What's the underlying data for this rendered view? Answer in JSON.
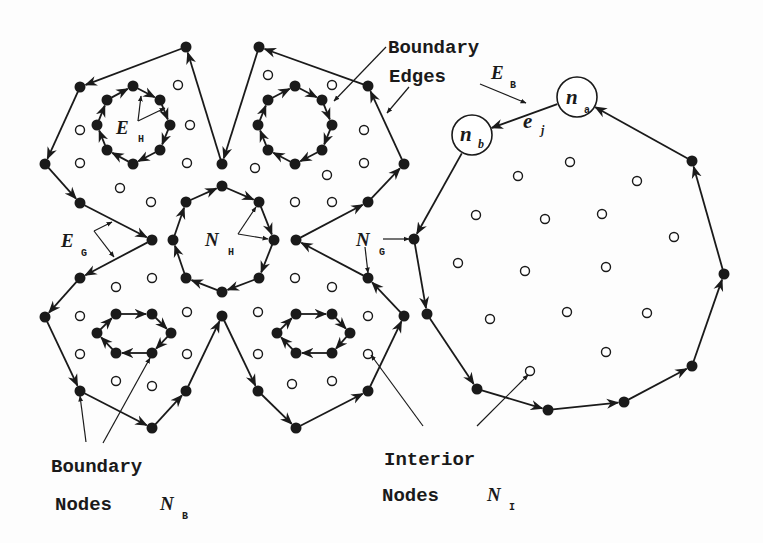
{
  "diagram": {
    "colors": {
      "ink": "#1a1a1a",
      "background": "#fdfdfd",
      "interior_node_fill": "#ffffff"
    },
    "labels": {
      "boundary_edges_line1": "Boundary",
      "boundary_edges_line2": "Edges",
      "boundary_nodes_line1": "Boundary",
      "boundary_nodes_line2": "Nodes",
      "interior_nodes_line1": "Interior",
      "interior_nodes_line2": "Nodes"
    },
    "symbols": {
      "E_B": {
        "main": "E",
        "sub": "B"
      },
      "E_H": {
        "main": "E",
        "sub": "H"
      },
      "E_G": {
        "main": "E",
        "sub": "G"
      },
      "N_H": {
        "main": "N",
        "sub": "H"
      },
      "N_G": {
        "main": "N",
        "sub": "G"
      },
      "N_B": {
        "main": "N",
        "sub": "B"
      },
      "N_I": {
        "main": "N",
        "sub": "I"
      },
      "n_a": {
        "main": "n",
        "sub": "a"
      },
      "n_b": {
        "main": "n",
        "sub": "b"
      },
      "e_j": {
        "main": "e",
        "sub": "j"
      }
    },
    "regions": [
      {
        "name": "left-flower-region",
        "outer_boundary": [
          [
            186,
            47
          ],
          [
            80,
            87
          ],
          [
            45,
            164
          ],
          [
            80,
            203
          ],
          [
            152,
            240
          ],
          [
            80,
            278
          ],
          [
            45,
            317
          ],
          [
            80,
            391
          ],
          [
            152,
            428
          ],
          [
            186,
            391
          ],
          [
            222,
            316
          ],
          [
            258,
            391
          ],
          [
            296,
            428
          ],
          [
            368,
            391
          ],
          [
            404,
            316
          ],
          [
            368,
            278
          ],
          [
            296,
            240
          ],
          [
            368,
            202
          ],
          [
            404,
            164
          ],
          [
            368,
            86
          ],
          [
            259,
            47
          ],
          [
            222,
            164
          ]
        ],
        "holes": [
          {
            "name": "hole-top-left",
            "nodes": [
              [
                133,
                86
              ],
              [
                160,
                100
              ],
              [
                170,
                125
              ],
              [
                160,
                150
              ],
              [
                133,
                164
              ],
              [
                107,
                150
              ],
              [
                97,
                125
              ],
              [
                107,
                100
              ]
            ]
          },
          {
            "name": "hole-top-right",
            "nodes": [
              [
                295,
                86
              ],
              [
                322,
                100
              ],
              [
                332,
                125
              ],
              [
                322,
                150
              ],
              [
                295,
                164
              ],
              [
                268,
                150
              ],
              [
                258,
                125
              ],
              [
                268,
                100
              ]
            ]
          },
          {
            "name": "hole-center",
            "nodes": [
              [
                222,
                186
              ],
              [
                259,
                202
              ],
              [
                274,
                240
              ],
              [
                259,
                278
              ],
              [
                222,
                292
              ],
              [
                186,
                278
              ],
              [
                173,
                240
              ],
              [
                186,
                202
              ]
            ]
          },
          {
            "name": "hole-bottom-left",
            "nodes": [
              [
                116,
                314
              ],
              [
                152,
                314
              ],
              [
                171,
                333
              ],
              [
                152,
                353
              ],
              [
                116,
                353
              ],
              [
                97,
                333
              ]
            ]
          },
          {
            "name": "hole-bottom-right",
            "nodes": [
              [
                296,
                314
              ],
              [
                332,
                314
              ],
              [
                350,
                333
              ],
              [
                332,
                353
              ],
              [
                296,
                353
              ],
              [
                277,
                333
              ]
            ]
          }
        ],
        "interior_nodes": [
          [
            178,
            85
          ],
          [
            80,
            130
          ],
          [
            190,
            125
          ],
          [
            80,
            163
          ],
          [
            187,
            163
          ],
          [
            120,
            188
          ],
          [
            151,
            202
          ],
          [
            268,
            75
          ],
          [
            332,
            85
          ],
          [
            364,
            130
          ],
          [
            255,
            168
          ],
          [
            327,
            175
          ],
          [
            364,
            163
          ],
          [
            295,
            202
          ],
          [
            332,
            202
          ],
          [
            116,
            287
          ],
          [
            152,
            278
          ],
          [
            80,
            316
          ],
          [
            187,
            312
          ],
          [
            80,
            354
          ],
          [
            187,
            354
          ],
          [
            116,
            381
          ],
          [
            152,
            386
          ],
          [
            295,
            278
          ],
          [
            332,
            287
          ],
          [
            258,
            312
          ],
          [
            368,
            316
          ],
          [
            258,
            354
          ],
          [
            368,
            354
          ],
          [
            292,
            384
          ],
          [
            332,
            381
          ]
        ]
      },
      {
        "name": "right-polygon-region",
        "outer_boundary": [
          [
            577,
            97
          ],
          [
            472,
            135
          ],
          [
            414,
            239
          ],
          [
            427,
            314
          ],
          [
            477,
            389
          ],
          [
            548,
            410
          ],
          [
            624,
            402
          ],
          [
            692,
            366
          ],
          [
            724,
            274
          ],
          [
            692,
            161
          ]
        ],
        "highlighted_nodes": [
          {
            "id": "n_a",
            "pos": [
              577,
              97
            ],
            "r": 20
          },
          {
            "id": "n_b",
            "pos": [
              472,
              135
            ],
            "r": 20
          }
        ],
        "interior_nodes": [
          [
            458,
            263
          ],
          [
            476,
            215
          ],
          [
            518,
            176
          ],
          [
            570,
            162
          ],
          [
            637,
            181
          ],
          [
            545,
            219
          ],
          [
            602,
            214
          ],
          [
            674,
            237
          ],
          [
            525,
            271
          ],
          [
            606,
            267
          ],
          [
            490,
            319
          ],
          [
            567,
            312
          ],
          [
            647,
            313
          ],
          [
            606,
            352
          ],
          [
            530,
            371
          ]
        ]
      }
    ]
  }
}
